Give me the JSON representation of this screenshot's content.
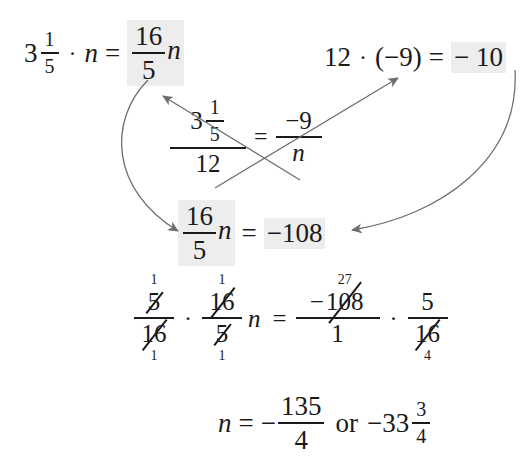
{
  "page": {
    "background": "#ffffff",
    "ink": "#1a1a1a",
    "highlight": "#ededed",
    "arrow_color": "#6e6e6e"
  },
  "line1": {
    "mixed_whole": "3",
    "mixed_num": "1",
    "mixed_den": "5",
    "dot": "·",
    "variable": "n",
    "equals": "=",
    "result_num": "16",
    "result_den": "5",
    "result_var": "n"
  },
  "line_right": {
    "left_factor": "12",
    "dot": "·",
    "open_paren": "(",
    "negative": "−",
    "right_factor": "9",
    "close_paren": ")",
    "equals": "=",
    "result": "− 10",
    "note": "clipped at right edge of image"
  },
  "proportion": {
    "left_num_whole": "3",
    "left_num_frac_num": "1",
    "left_num_frac_den": "5",
    "left_den": "12",
    "equals": "=",
    "right_num": "−9",
    "right_den": "n"
  },
  "line3": {
    "frac_num": "16",
    "frac_den": "5",
    "variable": "n",
    "equals": "=",
    "result": "−108"
  },
  "line4": {
    "left_frac1_num": "5",
    "left_frac1_num_tiny": "1",
    "left_frac1_den": "16",
    "left_frac1_den_tiny": "1",
    "dot": "·",
    "left_frac2_num": "16",
    "left_frac2_num_tiny": "1",
    "left_frac2_den": "5",
    "left_frac2_den_tiny": "1",
    "variable": "n",
    "equals": "=",
    "right_frac1_sign": "−",
    "right_frac1_num": "108",
    "right_frac1_num_tiny": "27",
    "right_frac1_den": "1",
    "dot2": "·",
    "right_frac2_num": "5",
    "right_frac2_den": "16",
    "right_frac2_den_tiny": "4"
  },
  "line5": {
    "variable": "n",
    "equals": "=",
    "sign": "−",
    "frac_num": "135",
    "frac_den": "4",
    "or": "or",
    "mixed_sign": "−",
    "mixed_whole": "33",
    "mixed_num": "3",
    "mixed_den": "4"
  },
  "arrows": [
    {
      "name": "cross-arrow-to-upper-left",
      "from": "proportion-left-numerator",
      "to": "line1-result-fraction"
    },
    {
      "name": "cross-arrow-to-upper-right",
      "from": "proportion-right-numerator",
      "to": "line-right-result"
    },
    {
      "name": "curve-arrow-left-down",
      "from": "line1-result-fraction",
      "to": "line3-left-fraction"
    },
    {
      "name": "curve-arrow-right-down",
      "from": "line-right-result",
      "to": "line3-result"
    }
  ]
}
